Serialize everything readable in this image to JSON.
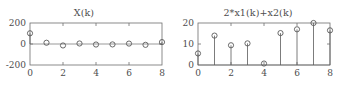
{
  "figure": {
    "background_color": "#ffffff",
    "axis_color": "#6e6e6e",
    "marker_color": "#5a5a5a",
    "text_color": "#4d4d4d"
  },
  "chart_data": [
    {
      "type": "scatter",
      "id": "left",
      "title": "X(k)",
      "xlabel": "",
      "ylabel": "",
      "xlim": [
        0,
        8
      ],
      "ylim": [
        -200,
        200
      ],
      "grid": false,
      "legend": "none",
      "marker": "circle-open",
      "xticks": [
        0,
        2,
        4,
        6,
        8
      ],
      "xtick_labels": [
        "0",
        "2",
        "4",
        "6",
        "8"
      ],
      "yticks": [
        -200,
        0,
        200
      ],
      "ytick_labels": [
        "-200",
        "0",
        "200"
      ],
      "x": [
        0,
        1,
        2,
        3,
        4,
        5,
        6,
        7,
        8
      ],
      "values": [
        102,
        12,
        -14,
        5,
        -5,
        -4,
        4,
        -8,
        18
      ]
    },
    {
      "type": "bar",
      "id": "right",
      "title": "2*x1(k)+x2(k)",
      "xlabel": "",
      "ylabel": "",
      "xlim": [
        0,
        8
      ],
      "ylim": [
        0,
        20
      ],
      "grid": false,
      "legend": "none",
      "marker": "circle-open",
      "style": "stem",
      "xticks": [
        0,
        2,
        4,
        6,
        8
      ],
      "xtick_labels": [
        "0",
        "2",
        "4",
        "6",
        "8"
      ],
      "yticks": [
        0,
        10,
        20
      ],
      "ytick_labels": [
        "0",
        "10",
        "20"
      ],
      "x": [
        0,
        1,
        2,
        3,
        4,
        5,
        6,
        7,
        8
      ],
      "values": [
        5.5,
        14,
        9.4,
        10.3,
        0.7,
        15.2,
        17,
        20,
        16.5
      ]
    }
  ]
}
